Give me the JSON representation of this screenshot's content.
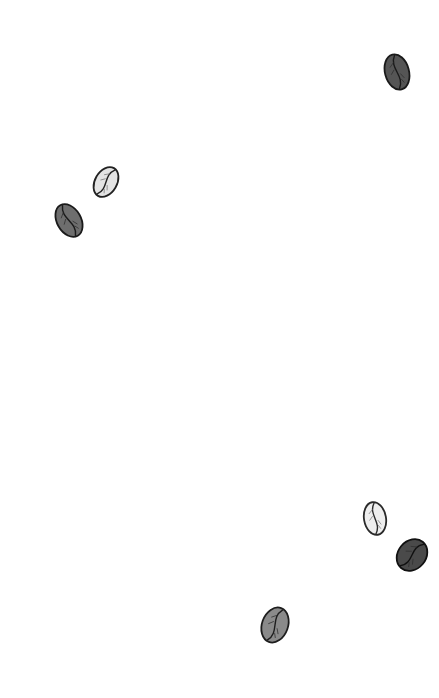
{
  "canvas": {
    "width": 439,
    "height": 698,
    "background": "#ffffff"
  },
  "beans": [
    {
      "icon": "coffee-bean-icon",
      "cx": 397,
      "cy": 72,
      "w": 24,
      "h": 36,
      "rotate": -15,
      "fill": "#555555",
      "stroke": "#1a1a1a",
      "tone": "dark"
    },
    {
      "icon": "coffee-bean-icon",
      "cx": 106,
      "cy": 182,
      "w": 22,
      "h": 32,
      "rotate": 30,
      "fill": "#e4e4e4",
      "stroke": "#222222",
      "tone": "light"
    },
    {
      "icon": "coffee-bean-icon",
      "cx": 69,
      "cy": 220,
      "w": 24,
      "h": 35,
      "rotate": -30,
      "fill": "#6e6e6e",
      "stroke": "#1a1a1a",
      "tone": "medium-dark"
    },
    {
      "icon": "coffee-bean-icon",
      "cx": 375,
      "cy": 518,
      "w": 22,
      "h": 33,
      "rotate": -10,
      "fill": "#eeeeee",
      "stroke": "#2a2a2a",
      "tone": "light"
    },
    {
      "icon": "coffee-bean-icon",
      "cx": 412,
      "cy": 555,
      "w": 28,
      "h": 34,
      "rotate": 40,
      "fill": "#4a4a4a",
      "stroke": "#111111",
      "tone": "dark"
    },
    {
      "icon": "coffee-bean-icon",
      "cx": 275,
      "cy": 625,
      "w": 26,
      "h": 36,
      "rotate": 20,
      "fill": "#8a8a8a",
      "stroke": "#1e1e1e",
      "tone": "medium"
    }
  ]
}
